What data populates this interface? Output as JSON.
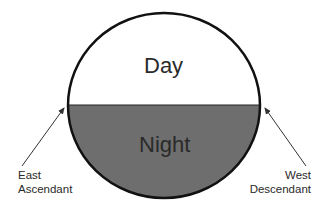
{
  "diagram": {
    "upper_region_label": "Day",
    "lower_region_label": "Night",
    "left_annotation": {
      "line1": "East",
      "line2": "Ascendant"
    },
    "right_annotation": {
      "line1": "West",
      "line2": "Descendant"
    },
    "colors": {
      "day_fill": "#ffffff",
      "night_fill": "#6e6e6e",
      "outline": "#111111",
      "arrow": "#333333"
    }
  }
}
